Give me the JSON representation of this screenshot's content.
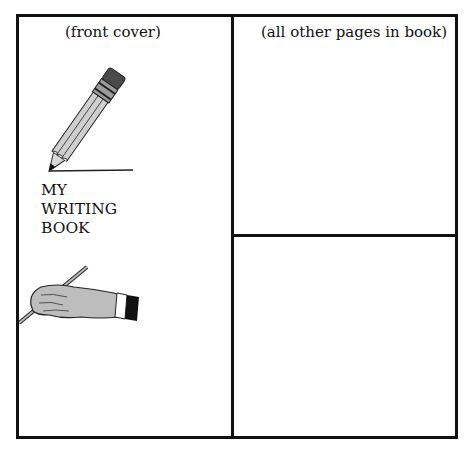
{
  "document": {
    "front_panel": {
      "caption": "(front cover)",
      "title_lines": [
        "MY",
        "WRITING",
        "BOOK"
      ],
      "illustrations": [
        "pencil-icon",
        "writing-hand-icon"
      ]
    },
    "other_panels": {
      "caption": "(all other pages in book)",
      "count": 2
    }
  }
}
